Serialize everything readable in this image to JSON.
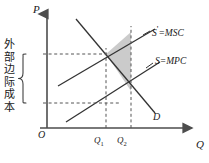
{
  "figure": {
    "type": "economics-supply-demand-externality-diagram",
    "axes": {
      "y_label": "P",
      "x_label": "Q",
      "origin_label": "O"
    },
    "curves": [
      {
        "id": "msc",
        "label": "S'=MSC",
        "label_main": "S",
        "label_prime": "'",
        "label_rest": "=MSC",
        "description": "social-marginal-cost supply curve"
      },
      {
        "id": "mpc",
        "label": "S=MPC",
        "label_main": "S",
        "label_prime": "",
        "label_rest": "=MPC",
        "description": "private-marginal-cost supply curve"
      },
      {
        "id": "demand",
        "label": "D",
        "description": "demand curve"
      }
    ],
    "ticks": [
      {
        "id": "q1",
        "main": "Q",
        "sub": "1"
      },
      {
        "id": "q2",
        "main": "Q",
        "sub": "2"
      }
    ],
    "annotation": {
      "id": "external-marginal-cost",
      "text": "外部边际成本",
      "characters": [
        "外",
        "部",
        "边",
        "际",
        "成",
        "本"
      ]
    },
    "shaded_region": {
      "id": "deadweight-loss-triangle",
      "fill": "#cccccc"
    },
    "colors": {
      "axis": "#4d4d4d",
      "curve": "#333333",
      "dashed": "#555555",
      "shade": "#cbcbcb",
      "text": "#1a1a1a",
      "background": "#ffffff"
    }
  }
}
